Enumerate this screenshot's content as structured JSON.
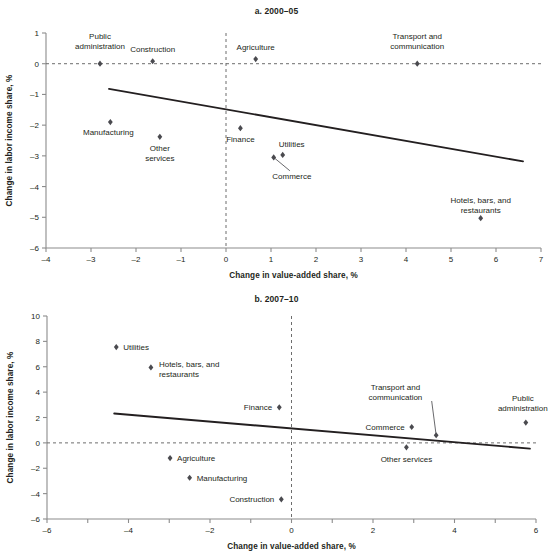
{
  "figure": {
    "axis_x_title": "Change in value-added share, %",
    "axis_y_title": "Change in labor income share, %"
  },
  "chart_data": [
    {
      "type": "scatter",
      "title": "a. 2000–05",
      "xlabel": "Change in value-added share, %",
      "ylabel": "Change in labor income share, %",
      "xlim": [
        -4,
        7
      ],
      "ylim": [
        -6,
        1
      ],
      "xticks": [
        -4,
        -3,
        -2,
        -1,
        0,
        1,
        2,
        3,
        4,
        5,
        6,
        7
      ],
      "yticks": [
        -6,
        -5,
        -4,
        -3,
        -2,
        -1,
        0,
        1
      ],
      "xticklabels": [
        "–4",
        "–3",
        "–2",
        "–1",
        "0",
        "1",
        "2",
        "3",
        "4",
        "5",
        "6",
        "7"
      ],
      "yticklabels": [
        "–6",
        "–5",
        "–4",
        "–3",
        "–2",
        "–1",
        "0",
        "1"
      ],
      "grid": false,
      "legend": "none",
      "reference_lines": [
        {
          "orientation": "horizontal",
          "value": 0,
          "style": "dashed"
        },
        {
          "orientation": "vertical",
          "value": 0,
          "style": "dashed"
        }
      ],
      "trendline": {
        "x": [
          -2.6,
          6.6
        ],
        "y": [
          -0.82,
          -3.18
        ],
        "style": "solid"
      },
      "points": [
        {
          "label": "Public administration",
          "x": -2.8,
          "y": 0.0
        },
        {
          "label": "Construction",
          "x": -1.63,
          "y": 0.08
        },
        {
          "label": "Agriculture",
          "x": 0.66,
          "y": 0.15
        },
        {
          "label": "Transport and communication",
          "x": 4.25,
          "y": 0.0
        },
        {
          "label": "Manufacturing",
          "x": -2.57,
          "y": -1.9
        },
        {
          "label": "Other services",
          "x": -1.47,
          "y": -2.38
        },
        {
          "label": "Finance",
          "x": 0.32,
          "y": -2.1
        },
        {
          "label": "Commerce",
          "x": 1.06,
          "y": -3.05
        },
        {
          "label": "Utilities",
          "x": 1.26,
          "y": -2.97
        },
        {
          "label": "Hotels, bars, and restaurants",
          "x": 5.66,
          "y": -5.03
        }
      ]
    },
    {
      "type": "scatter",
      "title": "b. 2007–10",
      "xlabel": "Change in value-added share, %",
      "ylabel": "Change in labor income share, %",
      "xlim": [
        -6,
        6
      ],
      "ylim": [
        -6,
        10
      ],
      "xticks": [
        -6,
        -5,
        -4,
        -3,
        -2,
        -1,
        0,
        1,
        2,
        3,
        4,
        5,
        6
      ],
      "yticks": [
        -6,
        -4,
        -2,
        0,
        2,
        4,
        6,
        8,
        10
      ],
      "xticklabels": [
        "–6",
        "",
        "–4",
        "",
        "–2",
        "",
        "0",
        "",
        "2",
        "",
        "4",
        "",
        "6"
      ],
      "yticklabels": [
        "–6",
        "–4",
        "–2",
        "0",
        "2",
        "4",
        "6",
        "8",
        "10"
      ],
      "grid": false,
      "legend": "none",
      "reference_lines": [
        {
          "orientation": "horizontal",
          "value": 0,
          "style": "dashed"
        },
        {
          "orientation": "vertical",
          "value": 0,
          "style": "dashed"
        }
      ],
      "trendline": {
        "x": [
          -4.35,
          5.85
        ],
        "y": [
          2.32,
          -0.45
        ],
        "style": "solid"
      },
      "points": [
        {
          "label": "Utilities",
          "x": -4.3,
          "y": 7.55
        },
        {
          "label": "Hotels, bars, and restaurants",
          "x": -3.45,
          "y": 5.95
        },
        {
          "label": "Finance",
          "x": -0.3,
          "y": 2.8
        },
        {
          "label": "Commerce",
          "x": 2.95,
          "y": 1.25
        },
        {
          "label": "Transport and communication",
          "x": 3.55,
          "y": 0.6
        },
        {
          "label": "Public administration",
          "x": 5.75,
          "y": 1.6
        },
        {
          "label": "Other services",
          "x": 2.82,
          "y": -0.35
        },
        {
          "label": "Agriculture",
          "x": -2.98,
          "y": -1.2
        },
        {
          "label": "Manufacturing",
          "x": -2.5,
          "y": -2.75
        },
        {
          "label": "Construction",
          "x": -0.25,
          "y": -4.45
        }
      ]
    }
  ]
}
